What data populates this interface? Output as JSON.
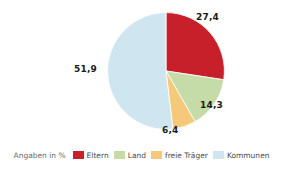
{
  "chart_data": {
    "type": "pie",
    "title": "",
    "subtitle": "",
    "xlabel": "",
    "ylabel": "",
    "note": "Angaben in %",
    "legend_position": "bottom",
    "grid": false,
    "start_angle_deg": 0,
    "direction": "clockwise",
    "categories": [
      "Eltern",
      "Land",
      "freie Träger",
      "Kommunen"
    ],
    "values": [
      27.4,
      14.3,
      6.4,
      51.9
    ],
    "value_labels": [
      "27,4",
      "14,3",
      "6,4",
      "51,9"
    ],
    "colors": [
      "#C8202A",
      "#C5DCA8",
      "#F5C87A",
      "#CFE6F0"
    ],
    "slices": [
      {
        "name": "Eltern",
        "value": 27.4,
        "label": "27,4",
        "color": "#C8202A"
      },
      {
        "name": "Land",
        "value": 14.3,
        "label": "14,3",
        "color": "#C5DCA8"
      },
      {
        "name": "freie Träger",
        "value": 6.4,
        "label": "6,4",
        "color": "#F5C87A"
      },
      {
        "name": "Kommunen",
        "value": 51.9,
        "label": "51,9",
        "color": "#CFE6F0"
      }
    ]
  },
  "legend": {
    "note": "Angaben in %",
    "items": [
      {
        "label": "Eltern",
        "color": "#C8202A"
      },
      {
        "label": "Land",
        "color": "#C5DCA8"
      },
      {
        "label": "freie Träger",
        "color": "#F5C87A"
      },
      {
        "label": "Kommunen",
        "color": "#CFE6F0"
      }
    ]
  }
}
